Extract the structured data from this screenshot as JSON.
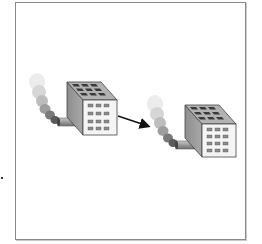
{
  "diagram": {
    "type": "illustration",
    "nodes": [
      {
        "id": "factory-1",
        "label": "",
        "kind": "factory-with-smoke"
      },
      {
        "id": "factory-2",
        "label": "",
        "kind": "factory-with-smoke"
      }
    ],
    "edges": [
      {
        "from": "factory-1",
        "to": "factory-2",
        "style": "arrow"
      }
    ],
    "text_labels": []
  },
  "colors": {
    "frame_border": "#8a8a8a",
    "building_front": "#f4f4f4",
    "building_side": "#9a9a9a",
    "building_top": "#b0b0b0",
    "roof_window": "#3a3a3a",
    "front_window": "#8c8c8c",
    "chimney": "#9c9c9c",
    "smoke_dark": "#555555",
    "smoke_light": "#e6e6e6",
    "arrow": "#111111"
  }
}
